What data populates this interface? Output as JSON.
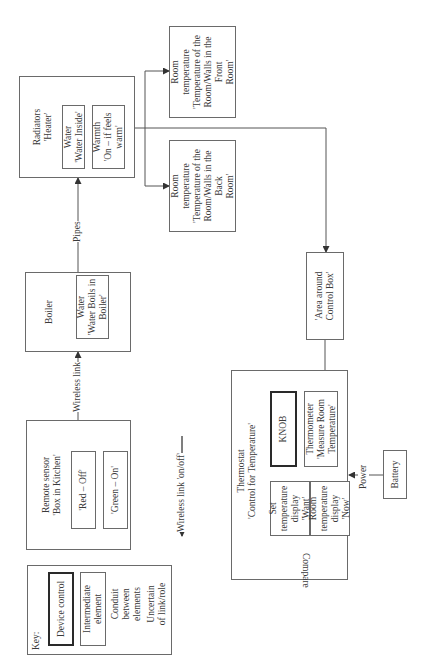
{
  "diagram": {
    "orientation": "rotated 90 degrees counter-clockwise",
    "key": {
      "title": "Key:",
      "device_control": "Device control",
      "intermediate_element": "Intermediate\nelement",
      "conduit": "Conduit\nbetween\nelements",
      "uncertain": "Uncertain\nof link/role"
    },
    "remote_sensor": {
      "title": "Remote sensor\n'Box in Kitchen'",
      "red": "'Red – Off'",
      "green": "'Green – On'"
    },
    "boiler": {
      "title": "Boiler",
      "water": "Water\n'Water Boils in\nBoiler'"
    },
    "radiators": {
      "title": "Radiators\n'Heater'",
      "water": "Water\n'Water Inside'",
      "warmth": "Warmth\n'On – if feels\nwarm'"
    },
    "room_front": {
      "text": "Room\ntemperature\n'Temperature of the\nRoom/Walls in the Front\nRoom'"
    },
    "room_back": {
      "text": "Room\ntemperature\n'Temperature of the\nRoom/Walls in the Back\nRoom'"
    },
    "area_control_box": {
      "text": "'Area around\nControl Box'"
    },
    "thermostat": {
      "title": "Thermostat\n'Control for Temperature'",
      "knob": "KNOB",
      "thermometer": "Thermometer\n'Measure Room\nTemperature'",
      "set_display": "Set\ntemperature\ndisplay\n'Want'",
      "room_display": "Room\ntemperature\ndisplay\n'Now'",
      "compare": "Compare"
    },
    "battery": {
      "text": "Battery"
    },
    "links": {
      "wireless_link": "Wireless link",
      "wireless_on_off": "Wireless link 'on/off'",
      "pipes": "Pipes",
      "power": "Power"
    }
  }
}
